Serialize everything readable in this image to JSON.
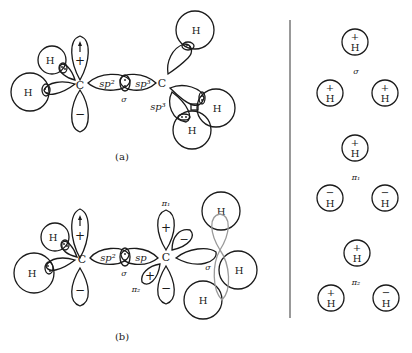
{
  "figure": {
    "panel_a": {
      "caption": "(a)",
      "atoms": {
        "carbon": "C",
        "hydrogen": "H"
      },
      "hybrid_left": "sp²",
      "hybrid_right": "sp³",
      "hybrid_lower": "sp³",
      "bond_label": "σ",
      "p_orbital_signs": {
        "top": "+",
        "bottom": "−"
      }
    },
    "panel_b": {
      "caption": "(b)",
      "atoms": {
        "carbon": "C",
        "hydrogen": "H"
      },
      "hybrid_left": "sp²",
      "hybrid_right": "sp",
      "bond_label": "σ",
      "bond_label_right": "σ",
      "pi1_label": "π₁",
      "pi2_label": "π₂",
      "p_orbital_signs": {
        "top": "+",
        "bottom": "−"
      },
      "pi1_signs": {
        "top": "+",
        "bottom": "−",
        "side": "−"
      },
      "pi2_signs": {
        "left": "+",
        "right": "−"
      }
    },
    "group_orbitals": {
      "sigma": {
        "label": "σ",
        "atoms": [
          {
            "sign": "+",
            "atom": "H"
          },
          {
            "sign": "+",
            "atom": "H"
          },
          {
            "sign": "+",
            "atom": "H"
          }
        ]
      },
      "pi1": {
        "label": "π₁",
        "atoms": [
          {
            "sign": "+",
            "atom": "H"
          },
          {
            "sign": "−",
            "atom": "H"
          },
          {
            "sign": "−",
            "atom": "H"
          }
        ]
      },
      "pi2": {
        "label": "π₂",
        "atoms": [
          {
            "sign": "+",
            "atom": "H"
          },
          {
            "sign": "+",
            "atom": "H"
          },
          {
            "sign": "−",
            "atom": "H"
          }
        ]
      }
    }
  }
}
